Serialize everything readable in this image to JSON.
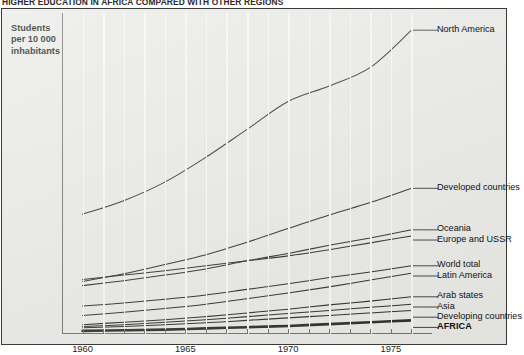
{
  "headline": "HIGHER EDUCATION IN AFRICA COMPARED WITH OTHER REGIONS",
  "y_axis_caption_line1": "Students",
  "y_axis_caption_line2": "per 10 000",
  "y_axis_caption_line3": "inhabitants",
  "margin_note": "Source",
  "chart_data": {
    "type": "line",
    "title": "HIGHER EDUCATION IN AFRICA COMPARED WITH OTHER REGIONS",
    "xlabel": "",
    "ylabel": "Students per 10 000 inhabitants",
    "xlim": [
      1959,
      1977
    ],
    "ylim": [
      0,
      500
    ],
    "ytick_labels": [
      "0",
      "50",
      "100",
      "150",
      "200",
      "250",
      "300",
      "350",
      "400",
      "450"
    ],
    "ytick_values": [
      0,
      50,
      100,
      150,
      200,
      250,
      300,
      350,
      400,
      450
    ],
    "xtick_labels": [
      "1960",
      "1965",
      "1970",
      "1975"
    ],
    "xtick_values": [
      1960,
      1965,
      1970,
      1975
    ],
    "grid": "vertical-white-minor",
    "legend": "right-side inline labels with leader lines",
    "x": [
      1960,
      1962,
      1964,
      1966,
      1968,
      1970,
      1972,
      1974,
      1976
    ],
    "series": [
      {
        "name": "North America",
        "emphasis": "normal",
        "values": [
          193,
          215,
          245,
          285,
          330,
          375,
          400,
          430,
          490
        ]
      },
      {
        "name": "Developed countries",
        "emphasis": "normal",
        "values": [
          85,
          97,
          112,
          128,
          148,
          170,
          192,
          212,
          235
        ]
      },
      {
        "name": "Oceania",
        "emphasis": "normal",
        "values": [
          78,
          86,
          95,
          105,
          118,
          130,
          143,
          155,
          168
        ]
      },
      {
        "name": "Europe and USSR",
        "emphasis": "normal",
        "values": [
          88,
          95,
          102,
          110,
          118,
          126,
          136,
          147,
          158
        ]
      },
      {
        "name": "World total",
        "emphasis": "normal",
        "values": [
          45,
          50,
          56,
          63,
          72,
          81,
          91,
          100,
          110
        ]
      },
      {
        "name": "Latin America",
        "emphasis": "normal",
        "values": [
          30,
          35,
          41,
          48,
          57,
          66,
          76,
          87,
          98
        ]
      },
      {
        "name": "Arab states",
        "emphasis": "normal",
        "values": [
          15,
          19,
          23,
          28,
          34,
          40,
          47,
          53,
          60
        ]
      },
      {
        "name": "Asia",
        "emphasis": "normal",
        "values": [
          12,
          15,
          19,
          23,
          28,
          33,
          38,
          43,
          48
        ]
      },
      {
        "name": "Developing countries",
        "emphasis": "normal",
        "values": [
          10,
          12,
          15,
          18,
          22,
          26,
          30,
          34,
          38
        ]
      },
      {
        "name": "AFRICA",
        "emphasis": "thick",
        "values": [
          5,
          6,
          7,
          9,
          11,
          13,
          16,
          19,
          22
        ]
      }
    ]
  }
}
